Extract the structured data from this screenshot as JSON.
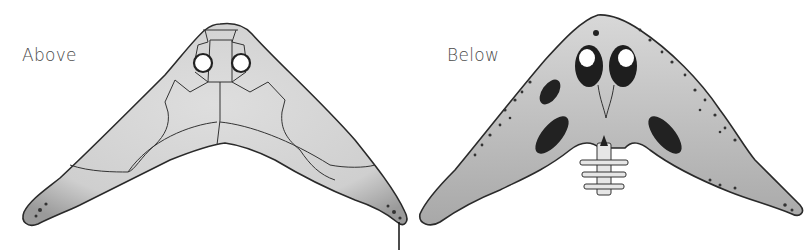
{
  "figure": {
    "views": [
      {
        "id": "above",
        "label": "Above",
        "description": "dorsal view with two orbits and cranial bone sutures"
      },
      {
        "id": "below",
        "label": "Below",
        "description": "ventral view with palatal openings, spotted texture and vertebrae"
      }
    ],
    "colors": {
      "bone_fill": "#d4d4d4",
      "outline": "#2a2a2a",
      "dark_fenestra": "#1e1e1e",
      "background": "#ffffff",
      "label_text": "#4a4a4a"
    },
    "annotation_line": {
      "present": true
    }
  }
}
